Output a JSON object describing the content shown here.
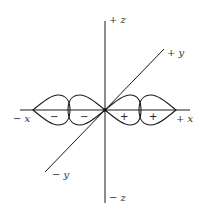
{
  "diagram": {
    "type": "orbital-lobes",
    "axes": {
      "z_pos": "+ z",
      "z_neg": "− z",
      "y_pos": "+ y",
      "y_neg": "− y",
      "x_pos": "+ x",
      "x_neg": "− x"
    },
    "lobes": [
      {
        "position": "far-left",
        "sign": "−"
      },
      {
        "position": "near-left",
        "sign": "−"
      },
      {
        "position": "near-right",
        "sign": "+"
      },
      {
        "position": "far-right",
        "sign": "+"
      }
    ],
    "colors": {
      "stroke": "#1a1a1a",
      "text": "#333333",
      "background": "#ffffff"
    }
  }
}
